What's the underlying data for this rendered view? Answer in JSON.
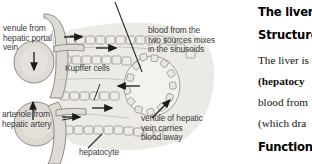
{
  "figure": {
    "type": "liver-lobule-blood-flow-diagram",
    "labels": {
      "venule_hepatic_portal_vein": "venule from\nhepatic portal\nvein",
      "kupffer_cells": "Kupffer cells",
      "arteriole_hepatic_artery": "arteriole from\nhepatic artery",
      "hepatocyte": "hepatocyte",
      "blood_mixes_sinusoids": "blood from the\ntwo sources mixes\nin the sinusoids",
      "venule_hepatic_vein": "venule of hepatic\nvein carries\nblood away"
    },
    "colors": {
      "vessel_fill": "#d6d3cd",
      "vessel_stroke": "#8c8880",
      "cell_fill": "#e6e3dd",
      "cell_stroke": "#8c8880",
      "sinusoid_fill": "#e9e7e2",
      "leader_line": "#2b2b2b",
      "arrow": "#1a1a1a",
      "label_text": "#3b3b3b",
      "background": "#ffffff"
    },
    "arrows": [
      {
        "name": "portal-inflow-arrow",
        "direction": "right"
      },
      {
        "name": "sinusoid-flow-arrow",
        "direction": "right"
      },
      {
        "name": "portal-down-arrow",
        "direction": "down"
      },
      {
        "name": "arteriole-up-arrow",
        "direction": "up"
      },
      {
        "name": "arteriole-inflow-arrow",
        "direction": "right"
      },
      {
        "name": "lower-sinusoid-flow-arrow",
        "direction": "right"
      },
      {
        "name": "central-vein-inflow-arrow",
        "direction": "left"
      },
      {
        "name": "hepatic-vein-outflow-arrow",
        "direction": "up-right"
      }
    ]
  },
  "text_column": {
    "title": "The liver",
    "section_structure": "Structure",
    "section_functions": "Functions",
    "paragraph_lines": [
      {
        "plain": "The liver is",
        "bold": ""
      },
      {
        "plain": "",
        "bold": "(hepatocy"
      },
      {
        "plain": "blood from",
        "bold": ""
      },
      {
        "plain": "(which dra",
        "bold": ""
      }
    ]
  }
}
